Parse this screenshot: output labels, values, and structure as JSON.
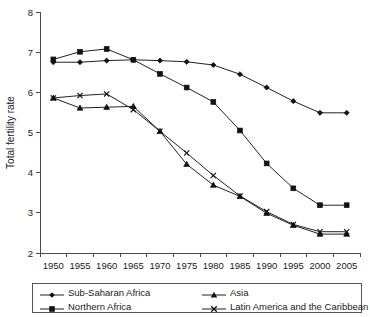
{
  "chart_data": {
    "type": "line",
    "title": "",
    "xlabel": "",
    "ylabel": "Total fertility rate",
    "categories": [
      "1950",
      "1955",
      "1960",
      "1965",
      "1970",
      "1975",
      "1980",
      "1985",
      "1990",
      "1995",
      "2000",
      "2005"
    ],
    "xtick_labels": [
      "1950",
      "1955",
      "1960",
      "1965",
      "1970",
      "1975",
      "1980",
      "1985",
      "1990",
      "1995",
      "2000",
      "2005"
    ],
    "ytick_labels": [
      "2",
      "3",
      "4",
      "5",
      "6",
      "7",
      "8"
    ],
    "ylim": [
      2,
      8
    ],
    "ytick_step": 1,
    "grid": false,
    "legend_position": "bottom",
    "series": [
      {
        "name": "Sub-Saharan Africa",
        "marker": "diamond",
        "color": "#111111",
        "values": [
          6.75,
          6.75,
          6.79,
          6.81,
          6.79,
          6.76,
          6.68,
          6.45,
          6.12,
          5.78,
          5.49,
          5.49
        ]
      },
      {
        "name": "Northern Africa",
        "marker": "square",
        "color": "#111111",
        "values": [
          6.82,
          7.01,
          7.08,
          6.81,
          6.46,
          6.12,
          5.76,
          5.05,
          4.23,
          3.61,
          3.19,
          3.19
        ]
      },
      {
        "name": "Asia",
        "marker": "triangle",
        "color": "#111111",
        "values": [
          5.86,
          5.61,
          5.63,
          5.65,
          5.03,
          4.21,
          3.69,
          3.41,
          2.99,
          2.69,
          2.47,
          2.47
        ]
      },
      {
        "name": "Latin America and the Caribbean",
        "marker": "x",
        "color": "#111111",
        "values": [
          5.86,
          5.92,
          5.96,
          5.57,
          5.03,
          4.49,
          3.93,
          3.42,
          3.03,
          2.71,
          2.53,
          2.53
        ]
      }
    ]
  },
  "legend": {
    "entries": [
      {
        "label": "Sub-Saharan Africa",
        "marker": "diamond"
      },
      {
        "label": "Northern Africa",
        "marker": "square"
      },
      {
        "label": "Asia",
        "marker": "triangle"
      },
      {
        "label": "Latin America and the Caribbean",
        "marker": "x"
      }
    ]
  },
  "axes": {
    "y_axis_title": "Total fertility rate"
  }
}
